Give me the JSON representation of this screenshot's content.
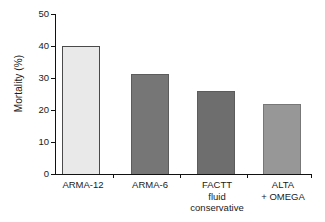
{
  "chart_data": {
    "type": "bar",
    "title": "",
    "xlabel": "",
    "ylabel": "Mortality (%)",
    "categories": [
      "ARMA-12",
      "ARMA-6",
      "FACTT\nfluid\nconservative",
      "ALTA\n+ OMEGA"
    ],
    "values": [
      40,
      31.3,
      26,
      22
    ],
    "ylim": [
      0,
      50
    ],
    "yticks": [
      0,
      10,
      20,
      30,
      40,
      50
    ],
    "ytick_labels": [
      "0",
      "10",
      "20",
      "30",
      "40",
      "50"
    ],
    "grid": false,
    "legend": "none",
    "bar_colors": [
      "#e9e9e9",
      "#767676",
      "#6e6e6e",
      "#979797"
    ],
    "bar_border_colors": [
      "#4a4a4a",
      "#5c5c5c",
      "#5c5c5c",
      "#777777"
    ],
    "axis_color": "#111111",
    "background": "#ffffff",
    "series": [
      {
        "name": "Mortality",
        "points": [
          {
            "category": "ARMA-12",
            "label": "ARMA-12",
            "value": 40
          },
          {
            "category": "ARMA-6",
            "label": "ARMA-6",
            "value": 31.3
          },
          {
            "category": "FACTT fluid conservative",
            "label": "FACTT\nfluid\nconservative",
            "value": 26
          },
          {
            "category": "ALTA + OMEGA",
            "label": "ALTA\n+ OMEGA",
            "value": 22
          }
        ]
      }
    ]
  }
}
